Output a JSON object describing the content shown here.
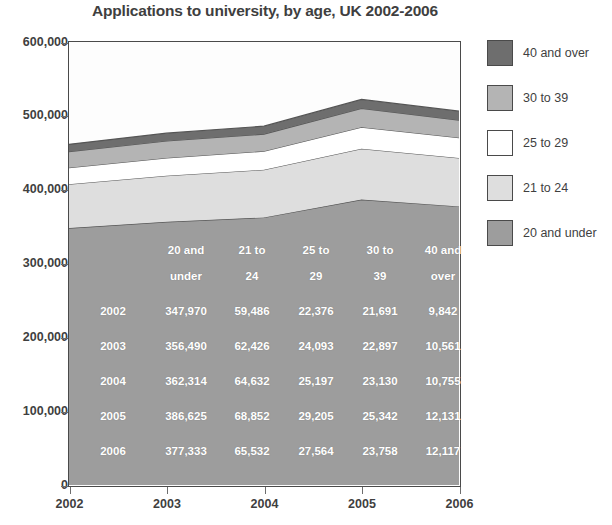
{
  "chart_data": {
    "type": "area",
    "title": "Applications to university, by age, UK 2002-2006",
    "xlabel": "",
    "ylabel": "",
    "stacked": true,
    "grid": false,
    "legend_position": "right",
    "categories": [
      "2002",
      "2003",
      "2004",
      "2005",
      "2006"
    ],
    "x": [
      2002,
      2003,
      2004,
      2005,
      2006
    ],
    "xlim": [
      2002,
      2006
    ],
    "ylim": [
      0,
      600000
    ],
    "y_ticks": [
      "0",
      "100,000",
      "200,000",
      "300,000",
      "400,000",
      "500,000",
      "600,000"
    ],
    "y_tick_values": [
      0,
      100000,
      200000,
      300000,
      400000,
      500000,
      600000
    ],
    "x_ticks": [
      "2002",
      "2003",
      "2004",
      "2005",
      "2006"
    ],
    "series": [
      {
        "name": "20 and under",
        "color": "#9d9d9d",
        "values": [
          347970,
          356490,
          362314,
          386625,
          377333
        ]
      },
      {
        "name": "21 to 24",
        "color": "#dedede",
        "values": [
          59486,
          62426,
          64632,
          68852,
          65532
        ]
      },
      {
        "name": "25 to 29",
        "color": "#ffffff",
        "values": [
          22376,
          24093,
          25197,
          29205,
          27564
        ]
      },
      {
        "name": "30 to 39",
        "color": "#b4b4b4",
        "values": [
          21691,
          22897,
          23130,
          25342,
          23758
        ]
      },
      {
        "name": "40 and over",
        "color": "#6e6e6e",
        "values": [
          9842,
          10561,
          10755,
          12131,
          12117
        ]
      }
    ],
    "totals": [
      461365,
      476467,
      486028,
      522155,
      506304
    ]
  },
  "legend": {
    "items": [
      {
        "label": "40 and over",
        "color": "#6e6e6e"
      },
      {
        "label": "30 to 39",
        "color": "#b4b4b4"
      },
      {
        "label": "25 to 29",
        "color": "#ffffff"
      },
      {
        "label": "21 to 24",
        "color": "#dedede"
      },
      {
        "label": "20 and under",
        "color": "#9d9d9d"
      }
    ]
  },
  "data_table": {
    "corner": "",
    "column_headers": [
      {
        "line1": "20 and",
        "line2": "under"
      },
      {
        "line1": "21 to",
        "line2": "24"
      },
      {
        "line1": "25 to",
        "line2": "29"
      },
      {
        "line1": "30 to",
        "line2": "39"
      },
      {
        "line1": "40 and",
        "line2": "over"
      }
    ],
    "rows": [
      {
        "year": "2002",
        "cells": [
          "347,970",
          "59,486",
          "22,376",
          "21,691",
          "9,842"
        ]
      },
      {
        "year": "2003",
        "cells": [
          "356,490",
          "62,426",
          "24,093",
          "22,897",
          "10,561"
        ]
      },
      {
        "year": "2004",
        "cells": [
          "362,314",
          "64,632",
          "25,197",
          "23,130",
          "10,755"
        ]
      },
      {
        "year": "2005",
        "cells": [
          "386,625",
          "68,852",
          "29,205",
          "25,342",
          "12,131"
        ]
      },
      {
        "year": "2006",
        "cells": [
          "377,333",
          "65,532",
          "27,564",
          "23,758",
          "12,117"
        ]
      }
    ]
  },
  "colors": {
    "axis": "#4a4a4a",
    "text": "#3f3f3f",
    "plot_background": "#fdfdfd",
    "series_outline": "#555555"
  }
}
